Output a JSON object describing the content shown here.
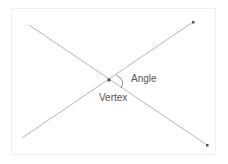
{
  "diagram": {
    "labels": {
      "angle": "Angle",
      "vertex": "Vertex"
    },
    "colors": {
      "line": "#b0b0b0",
      "point": "#555555",
      "text": "#555555"
    },
    "points": {
      "vertex": [
        109,
        80
      ],
      "line1_start": [
        29,
        25
      ],
      "line1_end": [
        207,
        145
      ],
      "line2_start": [
        22,
        138
      ],
      "line2_end": [
        193,
        22
      ]
    }
  }
}
